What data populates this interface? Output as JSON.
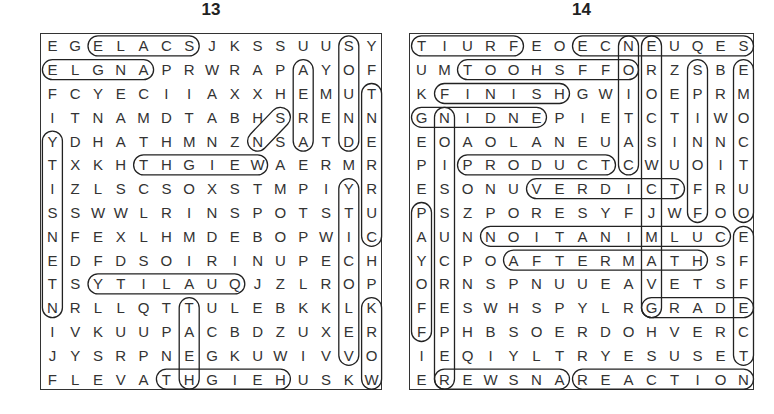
{
  "puzzles": [
    {
      "number": "13",
      "rows": [
        "EGELACSJKSSUUSY",
        "ELGNAPRWRAPAYOF",
        "FCYECIIAXXHEMUT",
        "ITNAMDTABHSRENN",
        "YDHATHMNZNSATDE",
        "TXKHTHGIEWAERMR",
        "IZLSCSOXSTMPIYR",
        "SSWWLRINSPOTSTU",
        "NFEXLHMDEBOPWIC",
        "EDFDSOIRINUPECH",
        "TSYTILAUQJZLROP",
        "NRLLQTTULEBKKLK",
        "IVKUUPACBDZUXER",
        "JYSRPNEGKUWIVVO",
        "FLEVATHGIEHUSKW"
      ],
      "found_words": [
        {
          "word": "SCALE",
          "start": [
            0,
            6
          ],
          "end": [
            0,
            2
          ]
        },
        {
          "word": "ANGLE",
          "start": [
            1,
            4
          ],
          "end": [
            1,
            0
          ]
        },
        {
          "word": "SOUND",
          "start": [
            0,
            13
          ],
          "end": [
            4,
            13
          ]
        },
        {
          "word": "WEIGHT",
          "start": [
            5,
            9
          ],
          "end": [
            5,
            4
          ]
        },
        {
          "word": "QUALITY",
          "start": [
            10,
            8
          ],
          "end": [
            10,
            2
          ]
        },
        {
          "word": "HEIGHT",
          "start": [
            14,
            10
          ],
          "end": [
            14,
            5
          ]
        },
        {
          "word": "HEAT",
          "start": [
            14,
            6
          ],
          "end": [
            11,
            6
          ]
        },
        {
          "word": "AREAS",
          "start": [
            1,
            11
          ],
          "end": [
            4,
            11
          ]
        },
        {
          "word": "SN",
          "start": [
            3,
            10
          ],
          "end": [
            4,
            9
          ]
        },
        {
          "word": "YTISNEDI",
          "start": [
            4,
            0
          ],
          "end": [
            11,
            0
          ]
        },
        {
          "word": "TNERRUC",
          "start": [
            2,
            14
          ],
          "end": [
            8,
            14
          ]
        },
        {
          "word": "YTICOLEV",
          "start": [
            6,
            13
          ],
          "end": [
            13,
            13
          ]
        },
        {
          "word": "KROW",
          "start": [
            11,
            14
          ],
          "end": [
            14,
            14
          ]
        }
      ]
    },
    {
      "number": "14",
      "rows": [
        "TIURFEOECNEUQES",
        "UMTOOHSFFORZSBE",
        "KFINISHGWIOEPRM",
        "GNIDNEPIETCTIWO",
        "EOAOLANEUASINNC",
        "PIPRODUCTCWUOIT",
        "ESONUVERDICTFRU",
        "PSZPORESYFJWFOO",
        "AUNNOITANIMLUCE",
        "YCPOAFTERMATHSF",
        "ORNSPNUUEAVETSF",
        "FESWHSPYLRGRADE",
        "FPHBSOERDOHVERC",
        "IEQIYLTRYESUSET",
        "EREWSNAREACTION"
      ],
      "found_words": [
        {
          "word": "FRUIT",
          "start": [
            0,
            4
          ],
          "end": [
            0,
            0
          ]
        },
        {
          "word": "SEQUENCE",
          "start": [
            0,
            14
          ],
          "end": [
            0,
            7
          ]
        },
        {
          "word": "OFFSHOOT",
          "start": [
            1,
            9
          ],
          "end": [
            1,
            2
          ]
        },
        {
          "word": "FINISH",
          "start": [
            2,
            1
          ],
          "end": [
            2,
            6
          ]
        },
        {
          "word": "ENDING",
          "start": [
            3,
            5
          ],
          "end": [
            3,
            0
          ]
        },
        {
          "word": "PRODUCT",
          "start": [
            5,
            2
          ],
          "end": [
            5,
            8
          ]
        },
        {
          "word": "VERDICT",
          "start": [
            6,
            5
          ],
          "end": [
            6,
            11
          ]
        },
        {
          "word": "CULMINATION",
          "start": [
            8,
            13
          ],
          "end": [
            8,
            3
          ]
        },
        {
          "word": "AFTERMATH",
          "start": [
            9,
            4
          ],
          "end": [
            9,
            12
          ]
        },
        {
          "word": "GRADE",
          "start": [
            11,
            10
          ],
          "end": [
            11,
            14
          ]
        },
        {
          "word": "ANSWER",
          "start": [
            14,
            6
          ],
          "end": [
            14,
            1
          ]
        },
        {
          "word": "REACTION",
          "start": [
            14,
            7
          ],
          "end": [
            14,
            14
          ]
        },
        {
          "word": "NOITCA",
          "start": [
            0,
            9
          ],
          "end": [
            5,
            9
          ]
        },
        {
          "word": "ERODES",
          "start": [
            0,
            10
          ],
          "end": [
            11,
            10
          ]
        },
        {
          "word": "SPINOFF",
          "start": [
            1,
            12
          ],
          "end": [
            7,
            12
          ]
        },
        {
          "word": "EMCTUO",
          "start": [
            1,
            14
          ],
          "end": [
            7,
            14
          ]
        },
        {
          "word": "EFFECT",
          "start": [
            8,
            14
          ],
          "end": [
            13,
            14
          ]
        },
        {
          "word": "NOISSUPER",
          "start": [
            3,
            1
          ],
          "end": [
            14,
            1
          ]
        },
        {
          "word": "PAYOFF",
          "start": [
            7,
            0
          ],
          "end": [
            12,
            0
          ]
        }
      ]
    }
  ]
}
